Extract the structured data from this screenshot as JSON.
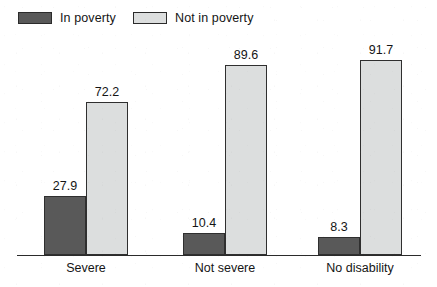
{
  "chart_data": {
    "type": "bar",
    "title": "",
    "subtitle": "",
    "xlabel": "",
    "ylabel": "",
    "grid": false,
    "legend_position": "top-left",
    "axis": {
      "y_visible": false,
      "x_visible": true,
      "ylim": [
        0,
        100
      ]
    },
    "categories": [
      "Severe",
      "Not severe",
      "No disability"
    ],
    "series": [
      {
        "name": "In poverty",
        "color": "#595959",
        "values": [
          27.9,
          10.4,
          8.3
        ],
        "labels": [
          "27.9",
          "10.4",
          "8.3"
        ]
      },
      {
        "name": "Not in poverty",
        "color": "#dcdede",
        "values": [
          72.2,
          89.6,
          91.7
        ],
        "labels": [
          "72.2",
          "89.6",
          "91.7"
        ]
      }
    ]
  },
  "legend": {
    "items": [
      {
        "label": "In poverty",
        "swatch": "dark"
      },
      {
        "label": "Not in poverty",
        "swatch": "light"
      }
    ]
  },
  "colors": {
    "in_poverty": "#595959",
    "not_in_poverty": "#dcdede",
    "outline": "#2f2f2f",
    "axis": "#2b2b2b",
    "text": "#151515",
    "background": "#ffffff"
  }
}
